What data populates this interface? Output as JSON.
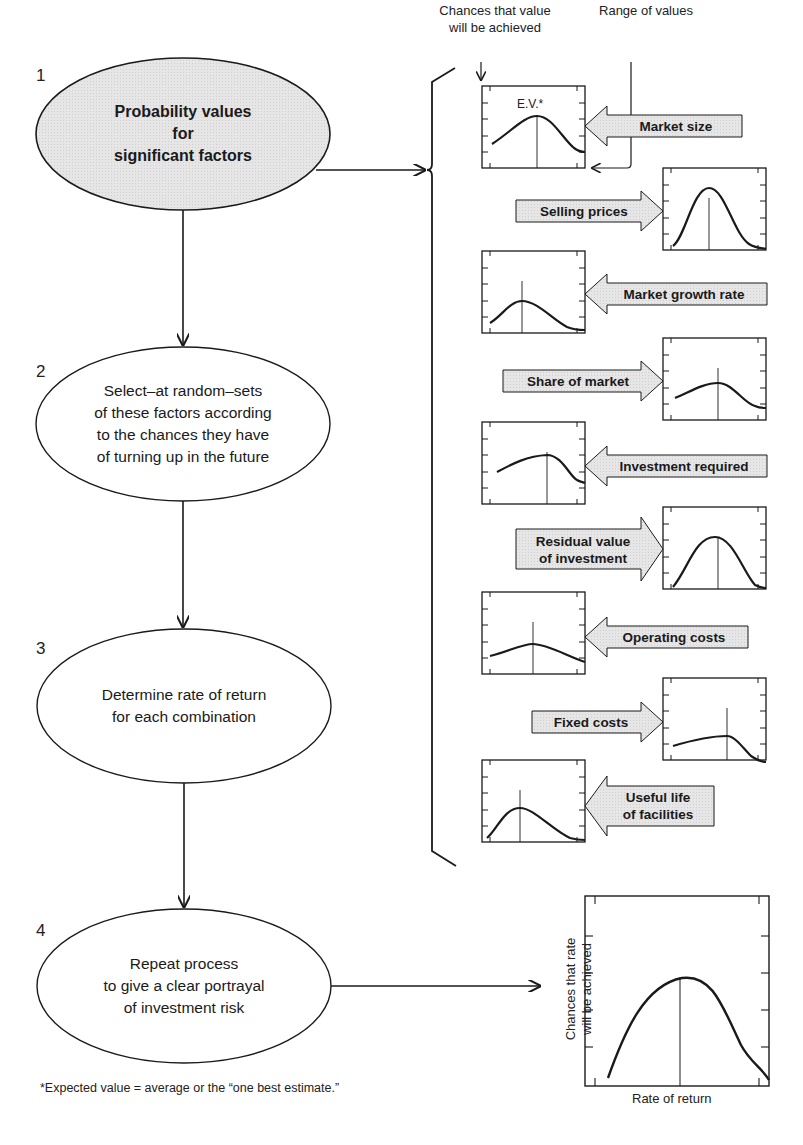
{
  "steps": [
    {
      "number": "1",
      "text": "Probability values\nfor\nsignificant factors",
      "shaded": true
    },
    {
      "number": "2",
      "text": "Select–at random–sets\nof these factors according\nto the chances they have\nof turning up in the future",
      "shaded": false
    },
    {
      "number": "3",
      "text": "Determine rate of return\nfor each combination",
      "shaded": false
    },
    {
      "number": "4",
      "text": "Repeat process\nto give a clear portrayal\nof investment risk",
      "shaded": false
    }
  ],
  "annotations": {
    "chances": "Chances that value\nwill be achieved",
    "range": "Range of values",
    "ev": "E.V.*"
  },
  "factors": [
    {
      "label": "Market size",
      "side": "left"
    },
    {
      "label": "Selling prices",
      "side": "right"
    },
    {
      "label": "Market growth rate",
      "side": "left"
    },
    {
      "label": "Share of market",
      "side": "right"
    },
    {
      "label": "Investment required",
      "side": "left"
    },
    {
      "label": "Residual value\nof investment",
      "side": "right"
    },
    {
      "label": "Operating costs",
      "side": "left"
    },
    {
      "label": "Fixed costs",
      "side": "right"
    },
    {
      "label": "Useful life\nof facilities",
      "side": "left"
    }
  ],
  "result_chart": {
    "ylabel": "Chances that rate\nwill be achieved",
    "xlabel": "Rate of return"
  },
  "footnote": "*Expected value = average or the “one best estimate.”",
  "colors": {
    "shade": "#e4e4e4",
    "line": "#1a1a1a",
    "background": "#ffffff"
  }
}
